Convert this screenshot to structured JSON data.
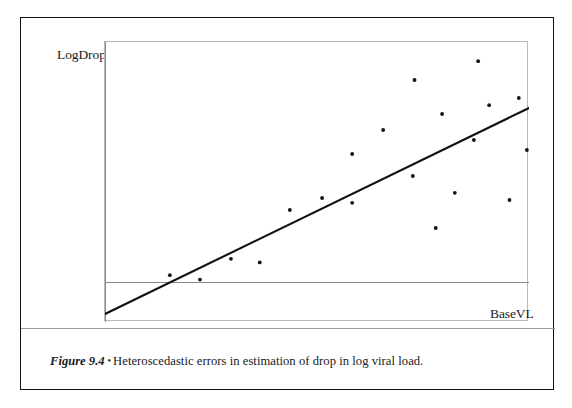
{
  "figure": {
    "number_label": "Figure 9.4",
    "separator_glyph": "•",
    "caption_text": "Heteroscedastic errors in estimation of drop in log viral load.",
    "border_color": "#14100f"
  },
  "plot": {
    "y_axis_label": "LogDropVL",
    "x_axis_label": "BaseVL",
    "origin_label": "(0, 0)",
    "frame_color": "#b9b9b9",
    "axis_color": "#8a8a8a",
    "point_color": "#111111",
    "line_color": "#111111"
  },
  "chart_data": {
    "type": "scatter",
    "title": "",
    "subtitle": "",
    "xlabel": "BaseVL",
    "ylabel": "LogDropVL",
    "grid": false,
    "legend": "none",
    "axis_origin_label": "(0, 0)",
    "xlim": [
      0,
      100
    ],
    "ylim": [
      -10,
      60
    ],
    "series": [
      {
        "name": "observations",
        "marker": "dot",
        "x": [
          15.3,
          22.4,
          29.7,
          36.5,
          43.6,
          51.2,
          58.3,
          58.3,
          72.6,
          65.6,
          78.0,
          82.5,
          73.0,
          87.0,
          90.6,
          95.4,
          97.6,
          99.5,
          88.0,
          79.5
        ],
        "y": [
          1.7,
          0.6,
          5.8,
          4.9,
          18.0,
          21.0,
          19.8,
          32.0,
          26.5,
          38.0,
          13.5,
          22.3,
          50.5,
          35.5,
          44.2,
          20.5,
          46.0,
          33.0,
          55.2,
          42.0
        ]
      }
    ],
    "fit_line": {
      "name": "least-squares fit",
      "x": [
        0,
        100
      ],
      "y": [
        -8.0,
        43.5
      ]
    }
  }
}
